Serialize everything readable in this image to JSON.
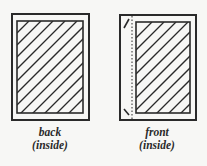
{
  "diagram": {
    "panels": [
      {
        "id": "back",
        "label_line1": "back",
        "label_line2": "(inside)",
        "has_fold_line": false
      },
      {
        "id": "front",
        "label_line1": "front",
        "label_line2": "(inside)",
        "has_fold_line": true
      }
    ],
    "colors": {
      "stroke": "#2a2a2a",
      "background": "#f7f7f5"
    }
  }
}
